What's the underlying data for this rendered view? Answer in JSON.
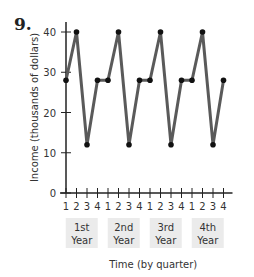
{
  "problem_number": "9.",
  "chart_data": {
    "type": "line",
    "title": "",
    "xlabel": "Time (by quarter)",
    "ylabel": "Income (thousands of dollars)",
    "ylim": [
      0,
      40
    ],
    "yticks": [
      0,
      10,
      20,
      30,
      40
    ],
    "grid": false,
    "legend": null,
    "x_tick_labels": [
      "1",
      "2",
      "3",
      "4",
      "1",
      "2",
      "3",
      "4",
      "1",
      "2",
      "3",
      "4",
      "1",
      "2",
      "3",
      "4"
    ],
    "x_groups": [
      "1st Year",
      "2nd Year",
      "3rd Year",
      "4th Year"
    ],
    "x": [
      1,
      2,
      3,
      4,
      5,
      6,
      7,
      8,
      9,
      10,
      11,
      12,
      13,
      14,
      15,
      16
    ],
    "series": [
      {
        "name": "Income",
        "values": [
          28,
          40,
          12,
          28,
          28,
          40,
          12,
          28,
          28,
          40,
          12,
          28,
          28,
          40,
          12,
          28
        ]
      }
    ],
    "colors": {
      "line": "#5a5a5a",
      "marker": "#111111",
      "axis": "#222222",
      "group_box": "#ebebeb"
    }
  }
}
